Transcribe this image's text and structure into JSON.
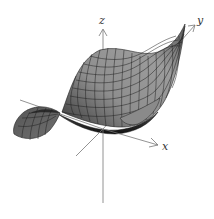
{
  "figure": {
    "type": "3d-surface-plot",
    "axes": {
      "x": {
        "label": "x"
      },
      "y": {
        "label": "y"
      },
      "z": {
        "label": "z"
      }
    },
    "colors": {
      "background": "#ffffff",
      "axis": "#777777",
      "surface_light": "#9a9a9a",
      "surface_mid": "#6e6e6e",
      "surface_dark": "#2a2a2a",
      "grid": "#1a1a1a"
    }
  }
}
